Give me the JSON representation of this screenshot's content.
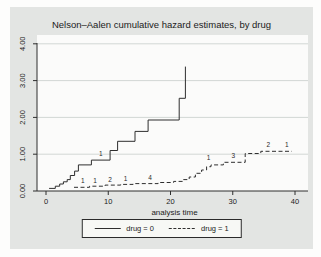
{
  "window": {
    "background": "#fdfdfc",
    "graph_background": "#e3e5e3"
  },
  "chart_data": {
    "type": "line",
    "subtype": "step-hazard",
    "title": "Nelson–Aalen cumulative hazard estimates, by drug",
    "xlabel": "analysis time",
    "ylabel": "",
    "xlim": [
      0,
      40
    ],
    "ylim": [
      0,
      4.2
    ],
    "grid": {
      "axis": "y",
      "values": [
        1,
        2,
        3,
        4
      ],
      "color": "#d2d7d4"
    },
    "xticks": {
      "values": [
        0,
        10,
        20,
        30,
        40
      ],
      "labels": [
        "0",
        "10",
        "20",
        "30",
        "40"
      ]
    },
    "yticks": {
      "values": [
        0,
        1,
        2,
        3,
        4
      ],
      "labels": [
        "0.00",
        "1.00",
        "2.00",
        "3.00",
        "4.00"
      ]
    },
    "axis_color": "#2e2e2e",
    "line_color": "#2e2e2e",
    "series": [
      {
        "name": "drug = 0",
        "style": "solid",
        "end_t": 22.4,
        "steps": [
          [
            0.5,
            0.07
          ],
          [
            1.5,
            0.13
          ],
          [
            2.2,
            0.19
          ],
          [
            2.8,
            0.25
          ],
          [
            3.4,
            0.31
          ],
          [
            3.9,
            0.42
          ],
          [
            4.6,
            0.54
          ],
          [
            5.2,
            0.71
          ],
          [
            7.3,
            0.84
          ],
          [
            10.3,
            1.1
          ],
          [
            11.5,
            1.35
          ],
          [
            14.3,
            1.62
          ],
          [
            16.4,
            1.93
          ],
          [
            21.4,
            2.52
          ],
          [
            22.4,
            3.38
          ]
        ]
      },
      {
        "name": "drug = 1",
        "style": "dashed",
        "end_t": 39.5,
        "steps": [
          [
            4.5,
            0.1
          ],
          [
            7.0,
            0.13
          ],
          [
            9.5,
            0.16
          ],
          [
            12.0,
            0.18
          ],
          [
            14.0,
            0.2
          ],
          [
            18.0,
            0.23
          ],
          [
            20.5,
            0.26
          ],
          [
            22.0,
            0.31
          ],
          [
            23.0,
            0.38
          ],
          [
            24.0,
            0.48
          ],
          [
            25.0,
            0.57
          ],
          [
            25.8,
            0.66
          ],
          [
            26.5,
            0.71
          ],
          [
            28.5,
            0.78
          ],
          [
            32.0,
            1.02
          ],
          [
            34.5,
            1.08
          ]
        ]
      }
    ],
    "annotations": [
      {
        "x": 8.8,
        "y": 0.95,
        "text": "1",
        "series": "drug = 0"
      },
      {
        "x": 5.9,
        "y": 0.21,
        "text": "1",
        "series": "drug = 1"
      },
      {
        "x": 7.9,
        "y": 0.21,
        "text": "1",
        "series": "drug = 1"
      },
      {
        "x": 10.3,
        "y": 0.25,
        "text": "2",
        "series": "drug = 1"
      },
      {
        "x": 12.8,
        "y": 0.27,
        "text": "1",
        "series": "drug = 1"
      },
      {
        "x": 16.7,
        "y": 0.3,
        "text": "4",
        "series": "drug = 1"
      },
      {
        "x": 26.1,
        "y": 0.85,
        "text": "1",
        "series": "drug = 1"
      },
      {
        "x": 30.1,
        "y": 0.89,
        "text": "3",
        "series": "drug = 1"
      },
      {
        "x": 35.7,
        "y": 1.19,
        "text": "2",
        "series": "drug = 1"
      },
      {
        "x": 38.7,
        "y": 1.19,
        "text": "1",
        "series": "drug = 1"
      }
    ],
    "legend": {
      "position": "bottom-center",
      "entries": [
        {
          "label": "drug = 0",
          "style": "solid"
        },
        {
          "label": "drug = 1",
          "style": "dashed"
        }
      ]
    }
  }
}
